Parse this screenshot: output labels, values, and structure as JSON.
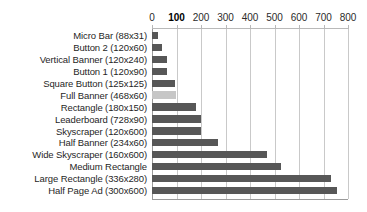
{
  "chart_data": {
    "type": "bar",
    "orientation": "horizontal",
    "title": "",
    "xlabel": "",
    "ylabel": "",
    "xlim": [
      0,
      800
    ],
    "xticks": [
      0,
      100,
      200,
      300,
      400,
      500,
      600,
      700,
      800
    ],
    "xtick_labels": [
      "0",
      "100",
      "200",
      "300",
      "400",
      "500",
      "600",
      "700",
      "800"
    ],
    "emphasized_tick": "100",
    "grid": true,
    "legend": "none",
    "bar_color": "#575757",
    "highlight_color": "#c6c6c6",
    "highlighted_category": "Full Banner (468x60)",
    "categories": [
      "Micro Bar (88x31)",
      "Button 2 (120x60)",
      "Vertical Banner (120x240)",
      "Button 1 (120x90)",
      "Square Button (125x125)",
      "Full Banner (468x60)",
      "Rectangle (180x150)",
      "Leaderboard (728x90)",
      "Skyscraper (120x600)",
      "Half Banner (234x60)",
      "Wide Skyscraper (160x600)",
      "Medium Rectangle",
      "Large Rectangle (336x280)",
      "Half Page Ad (300x600)"
    ],
    "values": [
      25,
      40,
      60,
      60,
      95,
      98,
      180,
      200,
      200,
      270,
      470,
      525,
      730,
      755
    ]
  }
}
